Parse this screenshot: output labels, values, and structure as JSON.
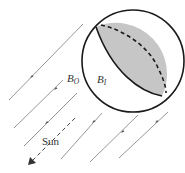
{
  "diagram": {
    "labels": {
      "outer_boundary": "B",
      "outer_boundary_sub": "O",
      "inner_boundary": "B",
      "inner_boundary_sub": "I",
      "sun": "Sun"
    },
    "colors": {
      "shaded_region": "#c8c8c8",
      "outline": "#1a1a1a",
      "rays": "#888888"
    },
    "sphere": {
      "cx": 133,
      "cy": 61,
      "r": 51
    },
    "rays": [
      {
        "x1": 9,
        "y1": 100,
        "x2": 83,
        "y2": 24,
        "ax": 31,
        "ay": 77
      },
      {
        "x1": 14,
        "y1": 128,
        "x2": 63,
        "y2": 80,
        "ax": 55,
        "ay": 89
      },
      {
        "x1": 24,
        "y1": 146,
        "x2": 77,
        "y2": 93,
        "ax": 46,
        "ay": 123
      },
      {
        "x1": 61,
        "y1": 159,
        "x2": 102,
        "y2": 113,
        "ax": 93,
        "ay": 122
      },
      {
        "x1": 90,
        "y1": 162,
        "x2": 138,
        "y2": 115,
        "ax": 122,
        "ay": 132
      },
      {
        "x1": 119,
        "y1": 158,
        "x2": 168,
        "y2": 112,
        "ax": 156,
        "ay": 122
      }
    ],
    "sun_direction": {
      "x1": 75,
      "y1": 118,
      "x2": 30,
      "y2": 163
    }
  }
}
